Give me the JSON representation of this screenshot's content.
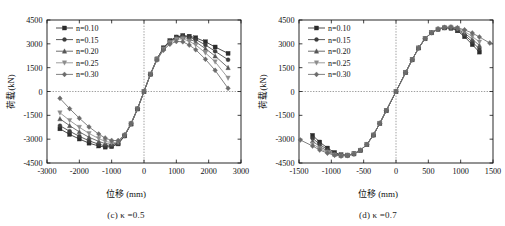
{
  "figure": {
    "background": "#ffffff",
    "panel_count": 2
  },
  "panels": [
    {
      "id": "panel-c",
      "caption_prefix": "(c)",
      "caption_symbol": "κ",
      "caption_value": "=0.5",
      "caption_full": "(c) κ =0.5"
    },
    {
      "id": "panel-d",
      "caption_prefix": "(d)",
      "caption_symbol": "κ",
      "caption_value": "=0.7",
      "caption_full": "(d) κ =0.7"
    }
  ],
  "legend": {
    "entries": [
      {
        "label": "n=0.10",
        "marker": "square",
        "color": "#2b2b2b"
      },
      {
        "label": "n=0.15",
        "marker": "circle",
        "color": "#3d3d3d"
      },
      {
        "label": "n=0.20",
        "marker": "triangle-up",
        "color": "#555555"
      },
      {
        "label": "n=0.25",
        "marker": "triangle-down",
        "color": "#8c8c8c"
      },
      {
        "label": "n=0.30",
        "marker": "diamond",
        "color": "#6b6b6b"
      }
    ]
  },
  "chart_data": [
    {
      "type": "line",
      "title": "(c) κ =0.5",
      "xlabel": "位移 (mm)",
      "ylabel": "荷载(kN)",
      "xlim": [
        -3000,
        3000
      ],
      "ylim": [
        -4500,
        4500
      ],
      "xticks": [
        -3000,
        -2000,
        -1000,
        0,
        1000,
        2000,
        3000
      ],
      "yticks": [
        -4500,
        -3000,
        -1500,
        0,
        1500,
        3000,
        4500
      ],
      "xtick_labels": [
        "-3000",
        "-2000",
        "-1000",
        "0",
        "1000",
        "2000",
        "3000"
      ],
      "ytick_labels": [
        "-4500",
        "-3000",
        "-1500",
        "0",
        "1500",
        "3000",
        "4500"
      ],
      "grid": false,
      "crosshair_gridlines": {
        "x": 0,
        "y": 0,
        "style": "dotted"
      },
      "legend_position": "upper-left",
      "series": [
        {
          "name": "n=0.10",
          "marker": "square",
          "color": "#2b2b2b",
          "x": [
            -2600,
            -2300,
            -2000,
            -1700,
            -1400,
            -1200,
            -1000,
            -800,
            -600,
            -400,
            -200,
            0,
            200,
            400,
            600,
            800,
            1000,
            1200,
            1400,
            1600,
            1900,
            2200,
            2600
          ],
          "y": [
            -2350,
            -2700,
            -2990,
            -3250,
            -3430,
            -3500,
            -3470,
            -3300,
            -2800,
            -2050,
            -1100,
            0,
            1100,
            2050,
            2750,
            3200,
            3430,
            3520,
            3480,
            3380,
            3130,
            2800,
            2400
          ]
        },
        {
          "name": "n=0.15",
          "marker": "circle",
          "color": "#3d3d3d",
          "x": [
            -2600,
            -2300,
            -2000,
            -1700,
            -1400,
            -1200,
            -1000,
            -800,
            -600,
            -400,
            -200,
            0,
            200,
            400,
            600,
            800,
            1000,
            1200,
            1400,
            1600,
            1900,
            2200,
            2600
          ],
          "y": [
            -2150,
            -2500,
            -2820,
            -3100,
            -3320,
            -3420,
            -3420,
            -3280,
            -2790,
            -2040,
            -1090,
            0,
            1090,
            2040,
            2730,
            3180,
            3420,
            3500,
            3420,
            3270,
            2930,
            2530,
            2000
          ]
        },
        {
          "name": "n=0.20",
          "marker": "triangle-up",
          "color": "#555555",
          "x": [
            -2600,
            -2300,
            -2000,
            -1700,
            -1400,
            -1200,
            -1000,
            -800,
            -600,
            -400,
            -200,
            0,
            200,
            400,
            600,
            800,
            1000,
            1200,
            1400,
            1600,
            1900,
            2200,
            2600
          ],
          "y": [
            -1720,
            -2150,
            -2540,
            -2880,
            -3140,
            -3280,
            -3320,
            -3230,
            -2770,
            -2030,
            -1085,
            0,
            1085,
            2030,
            2700,
            3140,
            3370,
            3430,
            3310,
            3120,
            2700,
            2230,
            1500
          ]
        },
        {
          "name": "n=0.25",
          "marker": "triangle-down",
          "color": "#8c8c8c",
          "x": [
            -2600,
            -2300,
            -2000,
            -1700,
            -1400,
            -1200,
            -1000,
            -800,
            -600,
            -400,
            -200,
            0,
            200,
            400,
            600,
            800,
            1000,
            1200,
            1400,
            1600,
            1900,
            2200,
            2600
          ],
          "y": [
            -1340,
            -1820,
            -2250,
            -2640,
            -2960,
            -3140,
            -3220,
            -3180,
            -2750,
            -2020,
            -1080,
            0,
            1080,
            2010,
            2660,
            3080,
            3290,
            3320,
            3160,
            2930,
            2430,
            1870,
            850
          ]
        },
        {
          "name": "n=0.30",
          "marker": "diamond",
          "color": "#6b6b6b",
          "x": [
            -2600,
            -2300,
            -2000,
            -1700,
            -1400,
            -1200,
            -1000,
            -800,
            -600,
            -400,
            -200,
            0,
            200,
            400,
            600,
            800,
            1000,
            1200,
            1400,
            1600,
            1900,
            2200,
            2600
          ],
          "y": [
            -430,
            -1080,
            -1680,
            -2230,
            -2680,
            -2930,
            -3080,
            -3090,
            -2720,
            -2000,
            -1070,
            0,
            1070,
            1980,
            2600,
            2980,
            3150,
            3130,
            2920,
            2630,
            2030,
            1330,
            200
          ]
        }
      ]
    },
    {
      "type": "line",
      "title": "(d) κ =0.7",
      "xlabel": "位移 (mm)",
      "ylabel": "荷载(kN)",
      "xlim": [
        -1500,
        1500
      ],
      "ylim": [
        -4500,
        4500
      ],
      "xticks": [
        -1500,
        -1000,
        -500,
        0,
        500,
        1000,
        1500
      ],
      "yticks": [
        -4500,
        -3000,
        -1500,
        0,
        1500,
        3000,
        4500
      ],
      "xtick_labels": [
        "-1500",
        "-1000",
        "-500",
        "0",
        "500",
        "1000",
        "1500"
      ],
      "ytick_labels": [
        "-4500",
        "-3000",
        "-1500",
        "0",
        "1500",
        "3000",
        "4500"
      ],
      "grid": false,
      "crosshair_gridlines": {
        "x": 0,
        "y": 0,
        "style": "dotted"
      },
      "legend_position": "upper-left",
      "series": [
        {
          "name": "n=0.10",
          "marker": "square",
          "color": "#2b2b2b",
          "x": [
            -1290,
            -1180,
            -1060,
            -950,
            -850,
            -750,
            -650,
            -550,
            -450,
            -350,
            -250,
            -150,
            0,
            150,
            250,
            350,
            450,
            550,
            650,
            750,
            850,
            950,
            1060,
            1180,
            1290
          ],
          "y": [
            -2760,
            -3180,
            -3560,
            -3840,
            -3980,
            -4000,
            -3920,
            -3700,
            -3330,
            -2740,
            -2000,
            -1200,
            0,
            1200,
            2000,
            2740,
            3330,
            3700,
            3920,
            4000,
            3980,
            3820,
            3450,
            2950,
            2480
          ]
        },
        {
          "name": "n=0.15",
          "marker": "circle",
          "color": "#3d3d3d",
          "x": [
            -1290,
            -1180,
            -1060,
            -950,
            -850,
            -750,
            -650,
            -550,
            -450,
            -350,
            -250,
            -150,
            0,
            150,
            250,
            350,
            450,
            550,
            650,
            750,
            850,
            950,
            1060,
            1180,
            1290
          ],
          "y": [
            -2940,
            -3330,
            -3660,
            -3900,
            -4010,
            -4010,
            -3920,
            -3700,
            -3330,
            -2740,
            -2000,
            -1200,
            0,
            1200,
            2000,
            2740,
            3330,
            3700,
            3920,
            4010,
            4010,
            3880,
            3560,
            3120,
            2680
          ]
        },
        {
          "name": "n=0.20",
          "marker": "triangle-up",
          "color": "#555555",
          "x": [
            -1290,
            -1180,
            -1060,
            -950,
            -850,
            -750,
            -650,
            -550,
            -450,
            -350,
            -250,
            -150,
            0,
            150,
            250,
            350,
            450,
            550,
            650,
            750,
            850,
            950,
            1060,
            1180,
            1290
          ],
          "y": [
            -3120,
            -3460,
            -3750,
            -3950,
            -4030,
            -4020,
            -3930,
            -3700,
            -3330,
            -2740,
            -2000,
            -1200,
            0,
            1200,
            2000,
            2740,
            3330,
            3700,
            3930,
            4020,
            4030,
            3930,
            3670,
            3290,
            2900
          ]
        },
        {
          "name": "n=0.25",
          "marker": "triangle-down",
          "color": "#8c8c8c",
          "x": [
            -1290,
            -1180,
            -1060,
            -950,
            -850,
            -750,
            -650,
            -550,
            -450,
            -350,
            -250,
            -150,
            0,
            150,
            250,
            350,
            450,
            550,
            650,
            750,
            850,
            950,
            1060,
            1180,
            1290
          ],
          "y": [
            -3300,
            -3580,
            -3820,
            -3990,
            -4050,
            -4030,
            -3930,
            -3700,
            -3330,
            -2740,
            -2000,
            -1200,
            0,
            1200,
            2000,
            2740,
            3330,
            3700,
            3930,
            4030,
            4050,
            3980,
            3780,
            3460,
            3120
          ]
        },
        {
          "name": "n=0.30",
          "marker": "diamond",
          "color": "#6b6b6b",
          "x": [
            -1480,
            -1290,
            -1180,
            -1060,
            -950,
            -850,
            -750,
            -650,
            -550,
            -450,
            -350,
            -250,
            -150,
            0,
            150,
            250,
            350,
            450,
            550,
            650,
            750,
            850,
            950,
            1060,
            1180,
            1290,
            1450
          ],
          "y": [
            -3050,
            -3430,
            -3680,
            -3880,
            -4010,
            -4060,
            -4040,
            -3940,
            -3700,
            -3330,
            -2740,
            -2000,
            -1200,
            0,
            1200,
            2000,
            2740,
            3330,
            3700,
            3940,
            4040,
            4060,
            4010,
            3880,
            3680,
            3430,
            3050
          ]
        }
      ]
    }
  ]
}
